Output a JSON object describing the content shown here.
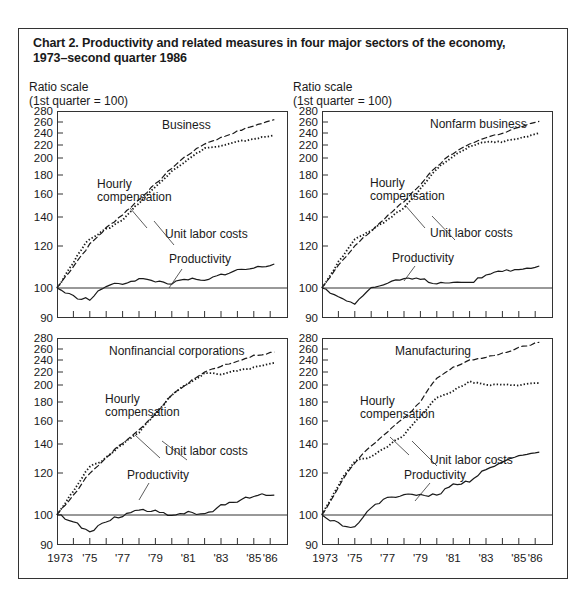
{
  "title_line1": "Chart 2.   Productivity and related measures in four major sectors of the economy,",
  "title_line2": "1973–second quarter 1986",
  "y_axis_label_line1": "Ratio scale",
  "y_axis_label_line2": "(1st quarter  =  100)",
  "y_ticks": [
    280,
    260,
    240,
    220,
    200,
    180,
    160,
    140,
    120,
    100,
    90
  ],
  "x_tick_labels": [
    "1973",
    "'75",
    "'77",
    "'79",
    "'81",
    "'83",
    "'85",
    "'86"
  ],
  "labels": {
    "hourly_line1": "Hourly",
    "hourly_line2": "compensation",
    "ulc": "Unit labor costs",
    "productivity": "Productivity"
  },
  "panels": [
    {
      "name": "Business"
    },
    {
      "name": "Nonfarm business"
    },
    {
      "name": "Nonfinancial corporations"
    },
    {
      "name": "Manufacturing"
    }
  ],
  "chart_data": [
    {
      "type": "line",
      "title": "Business",
      "ylabel": "Ratio scale (1st quarter = 100)",
      "yscale": "log",
      "ylim": [
        90,
        280
      ],
      "x": [
        1973,
        1974,
        1975,
        1976,
        1977,
        1978,
        1979,
        1980,
        1981,
        1982,
        1983,
        1984,
        1985,
        1986.25
      ],
      "series": [
        {
          "name": "Hourly compensation",
          "style": "dashed",
          "values": [
            100,
            110,
            121,
            132,
            142,
            155,
            170,
            188,
            205,
            222,
            232,
            243,
            253,
            264
          ]
        },
        {
          "name": "Unit labor costs",
          "style": "dotted",
          "values": [
            100,
            112,
            125,
            131,
            138,
            152,
            167,
            185,
            198,
            215,
            218,
            225,
            230,
            236
          ]
        },
        {
          "name": "Productivity",
          "style": "solid",
          "values": [
            100,
            97,
            96,
            101,
            102,
            104,
            103,
            102,
            104,
            103,
            106,
            108,
            109,
            111
          ]
        }
      ]
    },
    {
      "type": "line",
      "title": "Nonfarm business",
      "ylabel": "Ratio scale (1st quarter = 100)",
      "yscale": "log",
      "ylim": [
        90,
        280
      ],
      "x": [
        1973,
        1974,
        1975,
        1976,
        1977,
        1978,
        1979,
        1980,
        1981,
        1982,
        1983,
        1984,
        1985,
        1986.25
      ],
      "series": [
        {
          "name": "Hourly compensation",
          "style": "dashed",
          "values": [
            100,
            110,
            120,
            130,
            141,
            153,
            170,
            190,
            207,
            222,
            232,
            240,
            250,
            261
          ]
        },
        {
          "name": "Unit labor costs",
          "style": "dotted",
          "values": [
            100,
            112,
            124,
            130,
            138,
            148,
            165,
            187,
            202,
            218,
            225,
            225,
            230,
            240
          ]
        },
        {
          "name": "Productivity",
          "style": "solid",
          "values": [
            100,
            97,
            95,
            100,
            102,
            104,
            104,
            102,
            103,
            102,
            106,
            108,
            108,
            110
          ]
        }
      ]
    },
    {
      "type": "line",
      "title": "Nonfinancial corporations",
      "ylabel": "Ratio scale (1st quarter = 100)",
      "yscale": "log",
      "ylim": [
        90,
        280
      ],
      "x": [
        1973,
        1974,
        1975,
        1976,
        1977,
        1978,
        1979,
        1980,
        1981,
        1982,
        1983,
        1984,
        1985,
        1986.25
      ],
      "series": [
        {
          "name": "Hourly compensation",
          "style": "dashed",
          "values": [
            100,
            109,
            120,
            130,
            141,
            152,
            167,
            188,
            203,
            220,
            230,
            238,
            248,
            254
          ]
        },
        {
          "name": "Unit labor costs",
          "style": "dotted",
          "values": [
            100,
            111,
            124,
            130,
            140,
            150,
            167,
            188,
            202,
            218,
            217,
            222,
            227,
            235
          ]
        },
        {
          "name": "Productivity",
          "style": "solid",
          "values": [
            100,
            98,
            94,
            98,
            100,
            102,
            102,
            100,
            101,
            100,
            104,
            106,
            109,
            109
          ]
        }
      ]
    },
    {
      "type": "line",
      "title": "Manufacturing",
      "ylabel": "Ratio scale (1st quarter = 100)",
      "yscale": "log",
      "ylim": [
        90,
        280
      ],
      "x": [
        1973,
        1974,
        1975,
        1976,
        1977,
        1978,
        1979,
        1980,
        1981,
        1982,
        1983,
        1984,
        1985,
        1986.25
      ],
      "series": [
        {
          "name": "Hourly compensation",
          "style": "dashed",
          "values": [
            100,
            113,
            127,
            139,
            150,
            163,
            180,
            210,
            227,
            240,
            244,
            252,
            262,
            272
          ]
        },
        {
          "name": "Unit labor costs",
          "style": "dotted",
          "values": [
            100,
            114,
            128,
            131,
            138,
            148,
            165,
            185,
            193,
            205,
            200,
            200,
            200,
            203
          ]
        },
        {
          "name": "Productivity",
          "style": "solid",
          "values": [
            100,
            97,
            96,
            103,
            108,
            109,
            109,
            109,
            114,
            116,
            122,
            127,
            132,
            134
          ]
        }
      ]
    }
  ]
}
